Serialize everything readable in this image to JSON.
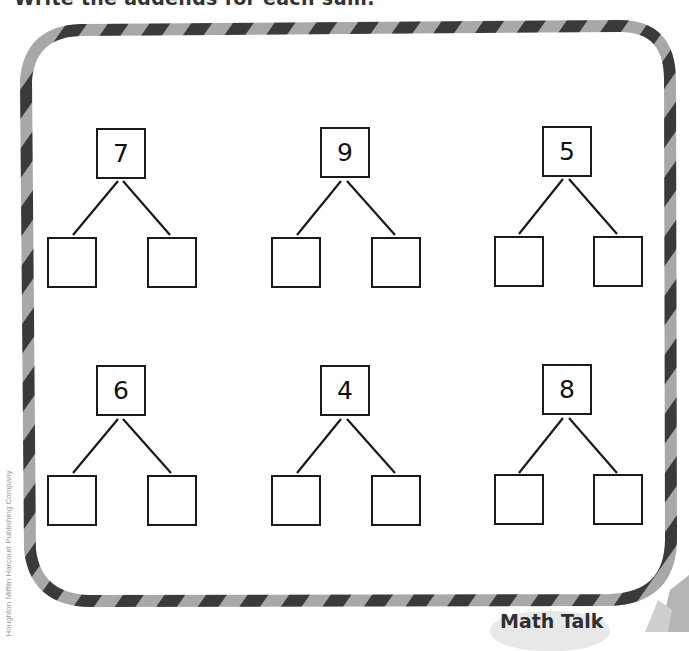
{
  "page": {
    "instruction": "Write the addends for each sum.",
    "copyright": "Houghton Mifflin Harcourt Publishing Company",
    "badge": {
      "label": "Math Talk"
    }
  },
  "frame": {
    "style": "candy-stripe rope",
    "stripe_dark": "#3a3a3a",
    "stripe_light": "#a8a8a8"
  },
  "number_bonds": [
    {
      "sum": "7",
      "addends": [
        "",
        ""
      ]
    },
    {
      "sum": "9",
      "addends": [
        "",
        ""
      ]
    },
    {
      "sum": "5",
      "addends": [
        "",
        ""
      ]
    },
    {
      "sum": "6",
      "addends": [
        "",
        ""
      ]
    },
    {
      "sum": "4",
      "addends": [
        "",
        ""
      ]
    },
    {
      "sum": "8",
      "addends": [
        "",
        ""
      ]
    }
  ]
}
